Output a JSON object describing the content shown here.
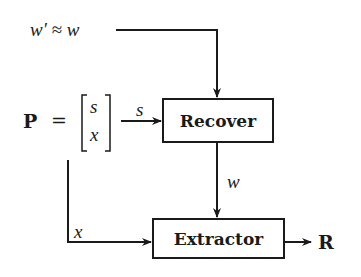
{
  "diagram": {
    "type": "block-diagram",
    "inputs": {
      "w_prime_label": "w′ ≈ w",
      "p_label": "P",
      "equals": "=",
      "vector_top": "s",
      "vector_bottom": "x"
    },
    "blocks": [
      {
        "id": "recover",
        "label": "Recover"
      },
      {
        "id": "extractor",
        "label": "Extractor"
      }
    ],
    "edges": [
      {
        "from": "w_prime",
        "to": "recover",
        "label": ""
      },
      {
        "from": "P",
        "to": "recover",
        "label": "s"
      },
      {
        "from": "recover",
        "to": "extractor",
        "label": "w"
      },
      {
        "from": "P",
        "to": "extractor",
        "label": "x"
      },
      {
        "from": "extractor",
        "to": "R",
        "label": ""
      }
    ],
    "edge_labels": {
      "s": "s",
      "w": "w",
      "x": "x"
    },
    "output": {
      "label": "R"
    }
  }
}
